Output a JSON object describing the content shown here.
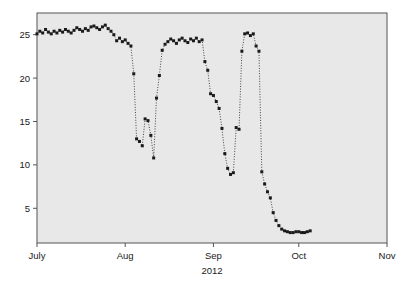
{
  "chart_data": {
    "type": "scatter",
    "title": "",
    "xlabel": "2012",
    "ylabel": "",
    "grid": false,
    "legend": null,
    "marker": "filled-square",
    "line_style": "dotted",
    "series_color": "#1a1a1a",
    "plot_background": "#e8e8e8",
    "page_background": "#ffffff",
    "border_color": "#555555",
    "xlim": [
      "2012-07-01",
      "2012-11-01"
    ],
    "ylim": [
      1,
      27.5
    ],
    "x_tick_labels": [
      "July",
      "Aug",
      "Sep",
      "Oct",
      "Nov"
    ],
    "x_tick_dates": [
      "2012-07-01",
      "2012-08-01",
      "2012-09-01",
      "2012-10-01",
      "2012-11-01"
    ],
    "y_tick_labels": [
      "5",
      "10",
      "15",
      "20",
      "25"
    ],
    "y_tick_values": [
      5,
      10,
      15,
      20,
      25
    ],
    "series": [
      {
        "name": "measurement",
        "x": [
          "2012-07-01",
          "2012-07-02",
          "2012-07-03",
          "2012-07-04",
          "2012-07-05",
          "2012-07-06",
          "2012-07-07",
          "2012-07-08",
          "2012-07-09",
          "2012-07-10",
          "2012-07-11",
          "2012-07-12",
          "2012-07-13",
          "2012-07-14",
          "2012-07-15",
          "2012-07-16",
          "2012-07-17",
          "2012-07-18",
          "2012-07-19",
          "2012-07-20",
          "2012-07-21",
          "2012-07-22",
          "2012-07-23",
          "2012-07-24",
          "2012-07-25",
          "2012-07-26",
          "2012-07-27",
          "2012-07-28",
          "2012-07-29",
          "2012-07-30",
          "2012-07-31",
          "2012-08-01",
          "2012-08-02",
          "2012-08-03",
          "2012-08-04",
          "2012-08-05",
          "2012-08-06",
          "2012-08-07",
          "2012-08-08",
          "2012-08-09",
          "2012-08-10",
          "2012-08-11",
          "2012-08-12",
          "2012-08-13",
          "2012-08-14",
          "2012-08-15",
          "2012-08-16",
          "2012-08-17",
          "2012-08-18",
          "2012-08-19",
          "2012-08-20",
          "2012-08-21",
          "2012-08-22",
          "2012-08-23",
          "2012-08-24",
          "2012-08-25",
          "2012-08-26",
          "2012-08-27",
          "2012-08-28",
          "2012-08-29",
          "2012-08-30",
          "2012-08-31",
          "2012-09-01",
          "2012-09-02",
          "2012-09-03",
          "2012-09-04",
          "2012-09-05",
          "2012-09-06",
          "2012-09-07",
          "2012-09-08",
          "2012-09-09",
          "2012-09-10",
          "2012-09-11",
          "2012-09-12",
          "2012-09-13",
          "2012-09-14",
          "2012-09-15",
          "2012-09-16",
          "2012-09-17",
          "2012-09-18",
          "2012-09-19",
          "2012-09-20",
          "2012-09-21",
          "2012-09-22",
          "2012-09-23",
          "2012-09-24",
          "2012-09-25",
          "2012-09-26",
          "2012-09-27",
          "2012-09-28",
          "2012-09-29",
          "2012-09-30",
          "2012-10-01",
          "2012-10-02",
          "2012-10-03",
          "2012-10-04",
          "2012-10-05"
        ],
        "values": [
          25.1,
          25.4,
          25.2,
          25.6,
          25.3,
          25.1,
          25.4,
          25.2,
          25.5,
          25.3,
          25.6,
          25.4,
          25.2,
          25.5,
          25.8,
          25.6,
          25.4,
          25.7,
          25.5,
          25.9,
          26.0,
          25.8,
          25.6,
          25.9,
          26.1,
          25.7,
          25.4,
          25.0,
          24.3,
          24.6,
          24.2,
          24.4,
          24.0,
          23.7,
          20.5,
          13.0,
          12.7,
          12.2,
          15.3,
          15.1,
          13.4,
          10.8,
          17.7,
          20.3,
          23.2,
          23.9,
          24.2,
          24.5,
          24.3,
          24.0,
          24.4,
          24.6,
          24.3,
          24.1,
          24.5,
          24.3,
          24.6,
          24.2,
          24.4,
          21.9,
          20.9,
          18.2,
          18.0,
          17.3,
          16.5,
          14.2,
          11.3,
          9.6,
          8.9,
          9.1,
          14.3,
          14.1,
          23.1,
          25.1,
          25.2,
          24.9,
          25.1,
          23.7,
          23.1,
          9.2,
          7.8,
          6.9,
          6.2,
          4.5,
          3.6,
          3.0,
          2.6,
          2.4,
          2.3,
          2.2,
          2.2,
          2.3,
          2.3,
          2.2,
          2.2,
          2.3,
          2.4
        ]
      }
    ]
  },
  "axis": {
    "x_caption": "2012"
  }
}
